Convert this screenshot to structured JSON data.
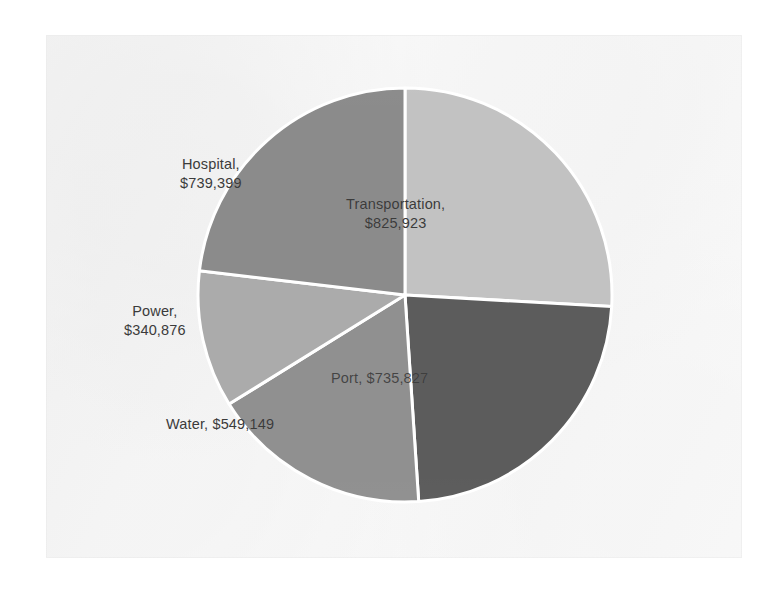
{
  "chart_data": {
    "type": "pie",
    "title": "",
    "subtitle": "",
    "xlabel": "",
    "ylabel": "",
    "legend_position": "none",
    "grid": false,
    "value_prefix": "$",
    "start_angle_deg": 0,
    "direction": "clockwise",
    "total": 3191174,
    "categories": [
      "Transportation",
      "Port",
      "Water",
      "Power",
      "Hospital"
    ],
    "values": [
      825923,
      735827,
      549149,
      340876,
      739399
    ],
    "labels": [
      "Transportation,\n$825,923",
      "Port,  $735,827",
      "Water,  $549,149",
      "Power,\n$340,876",
      "Hospital,\n$739,399"
    ],
    "slice_colors": [
      "#c2c2c2",
      "#5c5c5c",
      "#909090",
      "#ababab",
      "#8b8b8b"
    ],
    "slices": [
      {
        "name": "Transportation",
        "value": 825923,
        "value_text": "$825,923",
        "label": "Transportation,\n$825,923",
        "percent": 25.9,
        "color": "#c2c2c2",
        "label_color": "#3b3b3b",
        "start_deg": 0,
        "sweep_deg": 93.2,
        "label_x": 300,
        "label_y": 160
      },
      {
        "name": "Port",
        "value": 735827,
        "value_text": "$735,827",
        "label": "Port,  $735,827",
        "percent": 23.1,
        "color": "#5c5c5c",
        "label_color": "#3a3a3a",
        "start_deg": 93.2,
        "sweep_deg": 83.0,
        "label_x": 285,
        "label_y": 334
      },
      {
        "name": "Water",
        "value": 549149,
        "value_text": "$549,149",
        "label": "Water,  $549,149",
        "percent": 17.2,
        "color": "#909090",
        "label_color": "#3b3b3b",
        "start_deg": 176.2,
        "sweep_deg": 62.0,
        "label_x": 120,
        "label_y": 380
      },
      {
        "name": "Power",
        "value": 340876,
        "value_text": "$340,876",
        "label": "Power,\n$340,876",
        "percent": 10.7,
        "color": "#ababab",
        "label_color": "#3b3b3b",
        "start_deg": 238.2,
        "sweep_deg": 38.5,
        "label_x": 78,
        "label_y": 267
      },
      {
        "name": "Hospital",
        "value": 739399,
        "value_text": "$739,399",
        "label": "Hospital,\n$739,399",
        "percent": 23.2,
        "color": "#8b8b8b",
        "label_color": "#3b3b3b",
        "start_deg": 276.7,
        "sweep_deg": 83.3,
        "label_x": 134,
        "label_y": 120
      }
    ],
    "geometry": {
      "center_x": 359,
      "center_y": 260,
      "radius": 207,
      "separator_color": "#ffffff",
      "separator_width": 3
    },
    "background_color": "#fbfbfb",
    "page_background_color": "#ffffff"
  }
}
